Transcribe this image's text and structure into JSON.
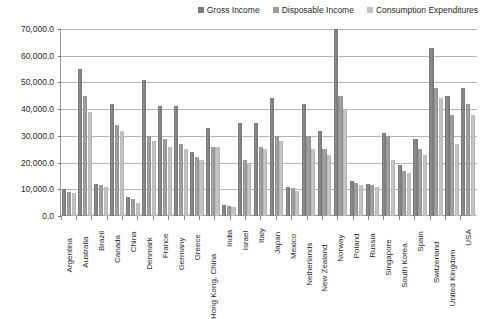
{
  "chart_data": {
    "type": "bar",
    "title": "",
    "subtitle": "",
    "xlabel": "",
    "ylabel": "",
    "ylim": [
      0,
      70000
    ],
    "ytick_values": [
      0,
      10000,
      20000,
      30000,
      40000,
      50000,
      60000,
      70000
    ],
    "ytick_labels": [
      "0.0",
      "10,000.0",
      "20,000.0",
      "30,000.0",
      "40,000.0",
      "50,000.0",
      "60,000.0",
      "70,000.0"
    ],
    "grid": true,
    "legend_position": "top-right",
    "orientation": "vertical",
    "categories": [
      "Argentina",
      "Australia",
      "Brazil",
      "Canada",
      "China",
      "Denmark",
      "France",
      "Germany",
      "Greece",
      "Hong Kong, China",
      "India",
      "Israel",
      "Italy",
      "Japan",
      "Mexico",
      "Netherlands",
      "New Zealand",
      "Norway",
      "Poland",
      "Russia",
      "Singapore",
      "South Korea",
      "Spain",
      "Switzerland",
      "United Kingdom",
      "USA"
    ],
    "series": [
      {
        "name": "Gross Income",
        "color": "#7a7a7a",
        "values": [
          10000,
          55000,
          12000,
          42000,
          7000,
          51000,
          41000,
          41000,
          24000,
          33000,
          4000,
          35000,
          35000,
          44000,
          11000,
          42000,
          32000,
          70000,
          13000,
          12000,
          31000,
          19000,
          29000,
          63000,
          45000,
          48000
        ]
      },
      {
        "name": "Disposable Income",
        "color": "#9b9b9b",
        "values": [
          9000,
          45000,
          11500,
          34000,
          6500,
          30000,
          29000,
          27000,
          22000,
          26000,
          3800,
          21000,
          26000,
          30000,
          10500,
          30000,
          25000,
          45000,
          12500,
          11500,
          30000,
          17000,
          25000,
          48000,
          38000,
          42000
        ]
      },
      {
        "name": "Consumption Expenditures",
        "color": "#c2c2c2",
        "values": [
          8500,
          39000,
          11000,
          32000,
          5000,
          28000,
          26000,
          25000,
          21000,
          26000,
          3500,
          20000,
          25000,
          28000,
          9500,
          25000,
          23000,
          40000,
          11500,
          11000,
          21000,
          16000,
          23000,
          44000,
          27000,
          38000
        ]
      }
    ]
  }
}
